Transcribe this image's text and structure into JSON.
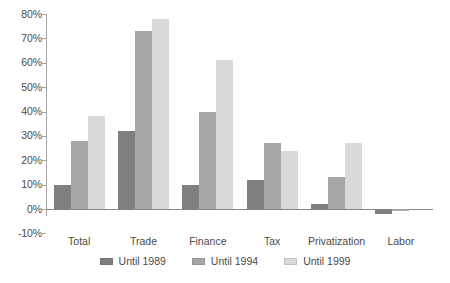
{
  "chart_data": {
    "type": "bar",
    "title": "",
    "subtitle": "",
    "xlabel": "",
    "ylabel": "",
    "categories": [
      "Total",
      "Trade",
      "Finance",
      "Tax",
      "Privatization",
      "Labor"
    ],
    "series": [
      {
        "name": "Until 1989",
        "color": "#7f7f7f",
        "values": [
          10,
          32,
          10,
          12,
          2,
          -2
        ]
      },
      {
        "name": "Until 1994",
        "color": "#a6a6a6",
        "values": [
          28,
          73,
          40,
          27,
          13,
          -1
        ]
      },
      {
        "name": "Until 1999",
        "color": "#d9d9d9",
        "values": [
          38,
          78,
          61,
          24,
          27,
          0
        ]
      }
    ],
    "ylim": [
      -10,
      80
    ],
    "ytick_step": 10,
    "ytick_labels": [
      "80%",
      "70%",
      "60%",
      "50%",
      "40%",
      "30%",
      "20%",
      "10%",
      "0%",
      "-10%"
    ],
    "ytick_values": [
      80,
      70,
      60,
      50,
      40,
      30,
      20,
      10,
      0,
      -10
    ],
    "grid": false,
    "legend_position": "bottom",
    "value_suffix": "%"
  }
}
